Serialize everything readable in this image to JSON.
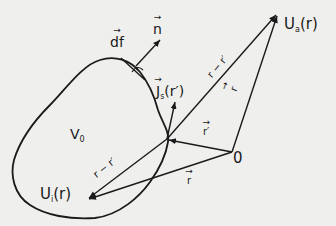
{
  "diagram": {
    "type": "vector field geometry",
    "labels": {
      "volume": "V₀",
      "volume_base": "V",
      "volume_sub": "0",
      "surface_element": "df",
      "normal": "n",
      "surface_current": "J",
      "surface_current_sub": "s",
      "surface_current_arg": "(r′)",
      "outside_field": "U",
      "outside_field_sub": "a",
      "outside_field_arg": "(r)",
      "inside_field": "U",
      "inside_field_sub": "i",
      "inside_field_arg": "(r)",
      "origin": "0",
      "r_prime": "r′",
      "r": "r",
      "r_to_Ua": "r",
      "diff_upper": "r − r′",
      "diff_lower": "r − r′"
    },
    "colors": {
      "background": "#efefed",
      "ink": "#1a1a1a"
    }
  }
}
